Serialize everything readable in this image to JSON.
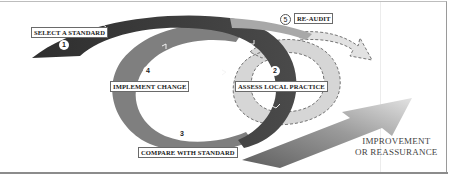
{
  "diagram": {
    "steps": [
      {
        "number": "1",
        "label": "SELECT A STANDARD"
      },
      {
        "number": "2",
        "label": "ASSESS LOCAL PRACTICE"
      },
      {
        "number": "3",
        "label": "COMPARE WITH STANDARD"
      },
      {
        "number": "4",
        "label": "IMPLEMENT CHANGE"
      },
      {
        "number": "5",
        "label": "RE-AUDIT"
      }
    ],
    "outcome": {
      "line1": "IMPROVEMENT",
      "line2": "OR REASSURANCE"
    },
    "colors": {
      "dark_band": "#3c3c3c",
      "mid_band": "#7d7d7d",
      "light_band": "#d4d4d4",
      "arrow_start": "#6a6a6a",
      "arrow_end": "#dcdcdc",
      "label_border": "#6a6a6a"
    }
  }
}
